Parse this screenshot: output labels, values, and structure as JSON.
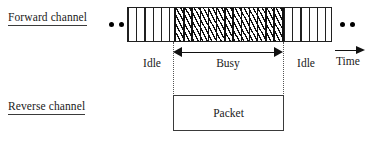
{
  "figure": {
    "rows": {
      "forward": {
        "label": "Forward channel"
      },
      "reverse": {
        "label": "Reverse channel"
      }
    },
    "slot_bar": {
      "segments": [
        {
          "state": "idle",
          "label": "Idle"
        },
        {
          "state": "busy",
          "label": "Busy"
        },
        {
          "state": "idle",
          "label": "Idle"
        }
      ]
    },
    "axis": {
      "label": "Time"
    },
    "packet": {
      "label": "Packet"
    },
    "ellipsis": {
      "glyph": "dot"
    },
    "colors": {
      "stroke": "#202020",
      "hatch": "#111111",
      "guide": "#555555",
      "text": "#1a1a1a",
      "background": "#ffffff"
    }
  }
}
